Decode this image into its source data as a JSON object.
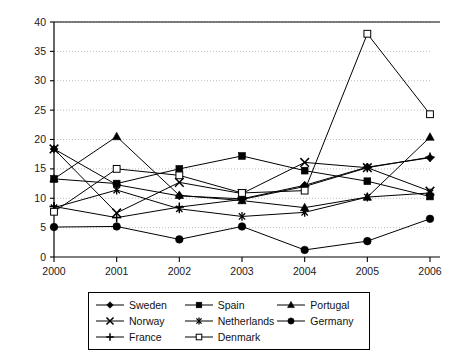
{
  "chart_data": {
    "type": "line",
    "title": "",
    "subtitle": "",
    "xlabel": "",
    "ylabel": "",
    "categories": [
      "2000",
      "2001",
      "2002",
      "2003",
      "2004",
      "2005",
      "2006"
    ],
    "x": [
      2000,
      2001,
      2002,
      2003,
      2004,
      2005,
      2006
    ],
    "xlim": [
      2000,
      2006
    ],
    "ylim": [
      0,
      40
    ],
    "yticks": [
      0,
      5,
      10,
      15,
      20,
      25,
      30,
      35,
      40
    ],
    "ytick_labels": [
      "0",
      "5",
      "10",
      "15",
      "20",
      "25",
      "30",
      "35",
      "40"
    ],
    "grid": "horizontal-dotted",
    "legend_position": "bottom",
    "legend_columns": 3,
    "series": [
      {
        "name": "Sweden",
        "marker": "filled-diamond",
        "values": [
          18.4,
          12.3,
          10.4,
          9.9,
          12.2,
          15.3,
          16.9
        ]
      },
      {
        "name": "Spain",
        "marker": "filled-square",
        "values": [
          13.3,
          12.5,
          15.0,
          17.2,
          14.7,
          12.9,
          10.3
        ]
      },
      {
        "name": "Portugal",
        "marker": "filled-triangle",
        "values": [
          13.3,
          20.5,
          10.5,
          9.6,
          8.4,
          10.2,
          20.4
        ]
      },
      {
        "name": "Norway",
        "marker": "cross-x",
        "values": [
          18.4,
          7.5,
          12.7,
          10.8,
          16.1,
          15.2,
          11.2
        ]
      },
      {
        "name": "Netherlands",
        "marker": "asterisk",
        "values": [
          8.4,
          11.4,
          8.2,
          6.9,
          7.6,
          10.2,
          10.9
        ]
      },
      {
        "name": "Germany",
        "marker": "filled-circle",
        "values": [
          5.1,
          5.2,
          3.0,
          5.2,
          1.2,
          2.7,
          6.5
        ]
      },
      {
        "name": "France",
        "marker": "plus",
        "values": [
          8.6,
          6.7,
          8.5,
          9.8,
          12.0,
          15.2,
          17.0
        ]
      },
      {
        "name": "Denmark",
        "marker": "open-square",
        "values": [
          7.7,
          15.0,
          13.9,
          10.9,
          11.3,
          38.0,
          24.3
        ]
      }
    ],
    "colors": {
      "line": "#000000",
      "grid": "#aaaaaa",
      "axis": "#000000",
      "background": "#ffffff"
    }
  },
  "legend": {
    "entries": [
      {
        "label": "Sweden",
        "marker": "filled-diamond"
      },
      {
        "label": "Norway",
        "marker": "cross-x"
      },
      {
        "label": "France",
        "marker": "plus"
      },
      {
        "label": "Spain",
        "marker": "filled-square"
      },
      {
        "label": "Netherlands",
        "marker": "asterisk"
      },
      {
        "label": "Denmark",
        "marker": "open-square"
      },
      {
        "label": "Portugal",
        "marker": "filled-triangle"
      },
      {
        "label": "Germany",
        "marker": "filled-circle"
      }
    ]
  },
  "axes": {
    "y_tick_labels": [
      "40",
      "35",
      "30",
      "25",
      "20",
      "15",
      "10",
      "5",
      "0"
    ],
    "x_tick_labels": [
      "2000",
      "2001",
      "2002",
      "2003",
      "2004",
      "2005",
      "2006"
    ]
  }
}
